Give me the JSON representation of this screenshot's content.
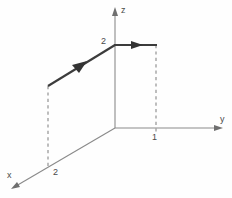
{
  "figure": {
    "kind": "3d-coordinate-axes-path-diagram",
    "background_color": "#fefefe",
    "axis_color": "#8a8a8a",
    "path_color": "#3c3c3c",
    "dash_color": "#9a9a9a",
    "label_color": "#4a4a4a"
  },
  "axes": {
    "z": {
      "label": "z",
      "label_x": 121,
      "label_y": 13,
      "from_x": 115,
      "from_y": 128,
      "to_x": 115,
      "to_y": 10,
      "arrow_points": "115,7 112,16 118,16"
    },
    "y": {
      "label": "y",
      "label_x": 220,
      "label_y": 122,
      "from_x": 115,
      "from_y": 128,
      "to_x": 219,
      "to_y": 128,
      "arrow_points": "223,128 214,125 214,131"
    },
    "x": {
      "label": "x",
      "label_x": 7,
      "label_y": 178,
      "from_x": 115,
      "from_y": 128,
      "to_x": 16,
      "to_y": 186,
      "arrow_points": "11,189 20,187 17,182"
    }
  },
  "ticks": [
    {
      "name": "z-tick-2",
      "text": "2",
      "x": 101,
      "y": 44
    },
    {
      "name": "y-tick-1",
      "text": "1",
      "x": 152,
      "y": 140
    },
    {
      "name": "x-tick-2",
      "text": "2",
      "x": 53,
      "y": 175
    }
  ],
  "path": {
    "segments": [
      {
        "name": "diagonal-segment",
        "x1": 48,
        "y1": 86,
        "x2": 115,
        "y2": 45,
        "arrow_points": "86,62 73,65 79,72"
      },
      {
        "name": "horizontal-segment",
        "x1": 114,
        "y1": 45,
        "x2": 157,
        "y2": 45,
        "arrow_points": "142,45 131,41 131,49"
      }
    ]
  },
  "guides": [
    {
      "name": "left-dashed-guide",
      "x1": 48,
      "y1": 86,
      "x2": 48,
      "y2": 166
    },
    {
      "name": "right-dashed-guide",
      "x1": 156,
      "y1": 45,
      "x2": 156,
      "y2": 133
    }
  ],
  "chart_data": {
    "type": "line",
    "title": "",
    "xlabel": "x",
    "ylabel": "y",
    "zlabel": "z",
    "coordinate_system": "3d-cartesian-oblique",
    "tick_labels": {
      "x": [
        "2"
      ],
      "y": [
        "1"
      ],
      "z": [
        "2"
      ]
    },
    "series": [
      {
        "name": "path",
        "points_3d": [
          {
            "x": 2,
            "y": 0,
            "z": 2
          },
          {
            "x": 0,
            "y": 0,
            "z": 2
          },
          {
            "x": 0,
            "y": 1,
            "z": 2
          }
        ],
        "arrows": [
          "mid-segment-1",
          "mid-segment-2"
        ]
      }
    ],
    "grid": false,
    "legend": null
  }
}
